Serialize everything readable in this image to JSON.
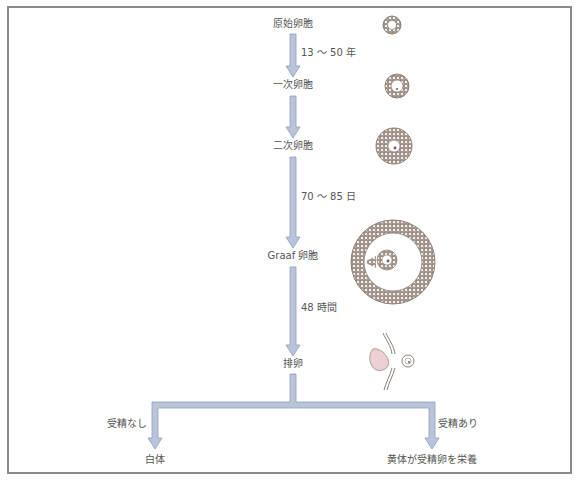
{
  "colors": {
    "frame": "#8a8a8a",
    "arrow_fill": "#b9c3d9",
    "arrow_edge": "#8f9cbb",
    "text": "#555555",
    "follicle": "#9a8c84",
    "corpus": "#e9c9cc"
  },
  "stages": [
    {
      "label": "原始卵胞",
      "icon": "primordial-follicle-icon"
    },
    {
      "label": "一次卵胞",
      "icon": "primary-follicle-icon"
    },
    {
      "label": "二次卵胞",
      "icon": "secondary-follicle-icon"
    },
    {
      "label": "Graaf 卵胞",
      "icon": "graafian-follicle-icon"
    },
    {
      "label": "排卵",
      "icon": "ovulation-icon"
    }
  ],
  "durations": [
    {
      "label": "13 ～ 50 年"
    },
    {
      "label": "70 ～ 85 日"
    },
    {
      "label": "48 時間"
    }
  ],
  "branches": {
    "left": {
      "condition": "受精なし",
      "result": "白体"
    },
    "right": {
      "condition": "受精あり",
      "result": "黄体が受精卵を栄養"
    }
  }
}
